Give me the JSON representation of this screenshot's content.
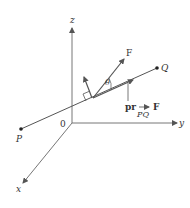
{
  "diagram": {
    "axes": {
      "x_label": "x",
      "y_label": "y",
      "z_label": "z",
      "origin_label": "0"
    },
    "points": {
      "P_label": "P",
      "Q_label": "Q"
    },
    "vectors": {
      "force_label": "F",
      "angle_label": "θ",
      "projection_prefix": "pr",
      "projection_vector": "F",
      "projection_subscript": "PQ"
    },
    "colors": {
      "line": "#555555",
      "text": "#333333",
      "background": "#ffffff"
    }
  }
}
